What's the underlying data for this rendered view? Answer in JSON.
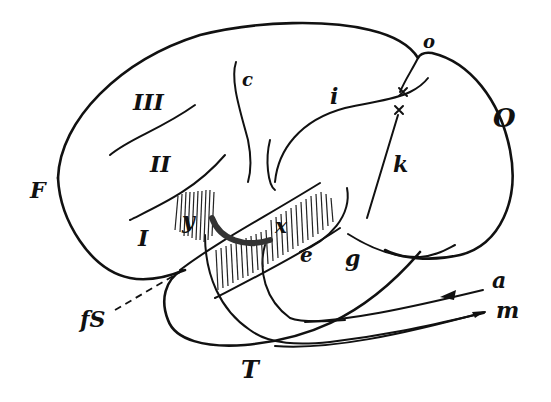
{
  "diagram": {
    "labels": {
      "frontal": "F",
      "occipital": "O",
      "occipital_notch": "o",
      "temporal": "T",
      "sylvian_fissure": "fS",
      "gyrus_1": "I",
      "gyrus_2": "II",
      "gyrus_3": "III",
      "central_sulcus": "c",
      "interparietal": "i",
      "sulcus_k": "k",
      "sulcus_g": "g",
      "sulcus_e": "e",
      "center_x": "x",
      "center_y": "y",
      "acoustic_path": "a",
      "motor_path": "m"
    },
    "colors": {
      "ink": "#111111",
      "background": "#ffffff",
      "arc": "#333333"
    }
  }
}
